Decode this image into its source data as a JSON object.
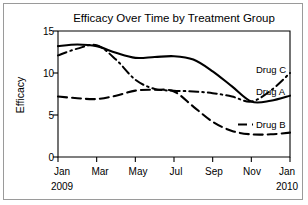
{
  "chart_data": {
    "type": "line",
    "title": "Efficacy Over Time by Treatment Group",
    "xlabel": "",
    "ylabel": "Efficacy",
    "ylim": [
      0,
      15
    ],
    "yticks": [
      0,
      5,
      10,
      15
    ],
    "ytick_labels": [
      "0",
      "5",
      "10",
      "15"
    ],
    "grid": false,
    "legend_position": "right-inline",
    "x": [
      "Jan 2009",
      "Feb 2009",
      "Mar 2009",
      "Apr 2009",
      "May 2009",
      "Jun 2009",
      "Jul 2009",
      "Aug 2009",
      "Sep 2009",
      "Oct 2009",
      "Nov 2009",
      "Dec 2009",
      "Jan 2010"
    ],
    "xtick_labels": [
      "Jan",
      "Mar",
      "May",
      "Jul",
      "Sep",
      "Nov",
      "Jan"
    ],
    "xtick_sublabels": [
      "2009",
      "",
      "",
      "",
      "",
      "",
      "2010"
    ],
    "series": [
      {
        "name": "Drug A",
        "style": "solid",
        "values": [
          13.2,
          13.4,
          13.2,
          12.4,
          11.8,
          11.9,
          12.0,
          11.6,
          10.2,
          8.4,
          6.6,
          6.7,
          7.3
        ]
      },
      {
        "name": "Drug B",
        "style": "dashed",
        "values": [
          7.2,
          7.0,
          6.9,
          7.3,
          7.9,
          8.0,
          7.8,
          6.0,
          4.2,
          3.1,
          2.7,
          2.7,
          2.9
        ]
      },
      {
        "name": "Drug C",
        "style": "dash-dot",
        "values": [
          12.1,
          12.9,
          13.3,
          11.6,
          9.2,
          8.1,
          7.9,
          7.8,
          7.6,
          7.2,
          6.6,
          7.9,
          10.0
        ]
      }
    ]
  },
  "axis": {
    "ylabel_text": "Efficacy",
    "ytick_0": "0",
    "ytick_5": "5",
    "ytick_10": "10",
    "ytick_15": "15",
    "xtick_jan_2009": "Jan",
    "xtick_year_2009": "2009",
    "xtick_mar": "Mar",
    "xtick_may": "May",
    "xtick_jul": "Jul",
    "xtick_sep": "Sep",
    "xtick_nov": "Nov",
    "xtick_jan_2010": "Jan",
    "xtick_year_2010": "2010"
  },
  "legend": {
    "drug_c": "Drug C",
    "drug_a": "Drug A",
    "drug_b": "Drug B"
  },
  "header": {
    "title": "Efficacy Over Time by Treatment Group"
  },
  "colors": {
    "ink": "#000000",
    "frame": "#9a9a9a",
    "background": "#ffffff"
  }
}
